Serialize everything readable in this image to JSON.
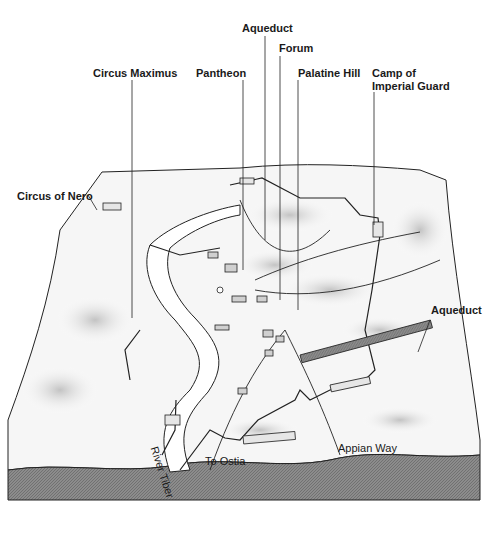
{
  "labels": {
    "aqueduct_top": "Aqueduct",
    "forum": "Forum",
    "circus_maximus": "Circus Maximus",
    "pantheon": "Pantheon",
    "palatine_hill": "Palatine Hill",
    "camp_line1": "Camp of",
    "camp_line2": "Imperial Guard",
    "circus_of_nero": "Circus of Nero",
    "aqueduct_right": "Aqueduct",
    "river_tiber": "River Tiber",
    "to_ostia": "To Ostia",
    "appian_way": "Appian Way"
  },
  "colors": {
    "ink": "#1a1a1a",
    "terrain": "#f4f4f4",
    "shade": "#cfcfcf",
    "base": "#8a8a8a"
  }
}
